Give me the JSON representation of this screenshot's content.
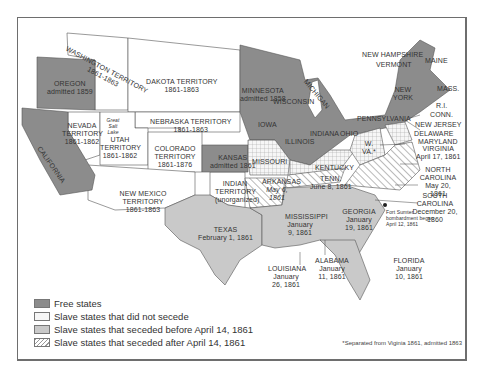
{
  "colors": {
    "free": "#8c8c8c",
    "not_seceded": "#f4f4f4",
    "seceded_before": "#c9c9c9",
    "seceded_after": "#e8e8e8",
    "territory": "#ffffff",
    "border": "#555555"
  },
  "regions": {
    "washington": {
      "name": "WASHINGTON TERRITORY",
      "dates": "1861-1863"
    },
    "oregon": {
      "name": "OREGON",
      "dates": "admitted 1859"
    },
    "california": {
      "name": "CALIFORNIA"
    },
    "nevada": {
      "name": "NEVADA TERRITORY",
      "dates": "1861-1862"
    },
    "great_salt_lake": {
      "name": "Great Salt Lake"
    },
    "utah": {
      "name": "UTAH TERRITORY",
      "dates": "1861-1862"
    },
    "dakota": {
      "name": "DAKOTA TERRITORY",
      "dates": "1861-1863"
    },
    "nebraska": {
      "name": "NEBRASKA TERRITORY",
      "dates": "1861-1863"
    },
    "colorado": {
      "name": "COLORADO TERRITORY",
      "dates": "1861-1876"
    },
    "new_mexico": {
      "name": "NEW MEXICO TERRITORY",
      "dates": "1861-1863"
    },
    "kansas": {
      "name": "KANSAS",
      "dates": "admitted 1861"
    },
    "indian": {
      "name": "INDIAN TERRITORY",
      "dates": "(unorganized)"
    },
    "texas": {
      "name": "TEXAS",
      "dates": "February 1, 1861"
    },
    "minnesota": {
      "name": "MINNESOTA",
      "dates": "admitted 1858"
    },
    "wisconsin": {
      "name": "WISCONSIN"
    },
    "michigan": {
      "name": "MICHIGAN"
    },
    "iowa": {
      "name": "IOWA"
    },
    "illinois": {
      "name": "ILLINOIS"
    },
    "indiana": {
      "name": "INDIANA"
    },
    "ohio": {
      "name": "OHIO"
    },
    "missouri": {
      "name": "MISSOURI"
    },
    "kentucky": {
      "name": "KENTUCKY"
    },
    "tennessee": {
      "name": "TENN.",
      "dates": "June 8, 1861"
    },
    "arkansas": {
      "name": "ARKANSAS",
      "dates": "May 6, 1861"
    },
    "mississippi": {
      "name": "MISSISSIPPI",
      "dates": "January 9, 1861"
    },
    "louisiana": {
      "name": "LOUISIANA",
      "dates": "January 26, 1861"
    },
    "alabama": {
      "name": "ALABAMA",
      "dates": "January 11, 1861"
    },
    "georgia": {
      "name": "GEORGIA",
      "dates": "January 19, 1861"
    },
    "florida": {
      "name": "FLORIDA",
      "dates": "January 10, 1861"
    },
    "south_carolina": {
      "name": "SOUTH CAROLINA",
      "dates": "December 20, 1860"
    },
    "fort_sumter": {
      "name": "Fort Sumter",
      "dates": "bombardment began April 12, 1861"
    },
    "north_carolina": {
      "name": "NORTH CAROLINA",
      "dates": "May 20, 1861"
    },
    "virginia": {
      "name": "VIRGINIA",
      "dates": "April 17, 1861"
    },
    "west_virginia": {
      "name": "W. VA.*"
    },
    "maryland": {
      "name": "MARYLAND"
    },
    "delaware": {
      "name": "DELAWARE"
    },
    "new_jersey": {
      "name": "NEW JERSEY"
    },
    "pennsylvania": {
      "name": "PENNSYLVANIA"
    },
    "new_york": {
      "name": "NEW YORK"
    },
    "connecticut": {
      "name": "CONN."
    },
    "rhode_island": {
      "name": "R.I."
    },
    "massachusetts": {
      "name": "MASS."
    },
    "vermont": {
      "name": "VERMONT"
    },
    "new_hampshire": {
      "name": "NEW HAMPSHIRE"
    },
    "maine": {
      "name": "MAINE"
    }
  },
  "legend": {
    "items": [
      {
        "label": "Free states",
        "key": "free"
      },
      {
        "label": "Slave states that did not secede",
        "key": "not_seceded"
      },
      {
        "label": "Slave states that seceded before April 14, 1861",
        "key": "seceded_before"
      },
      {
        "label": "Slave states that seceded after April 14, 1861",
        "key": "seceded_after"
      }
    ]
  },
  "footnote": "*Separated from Viginia 1861, admitted 1863"
}
